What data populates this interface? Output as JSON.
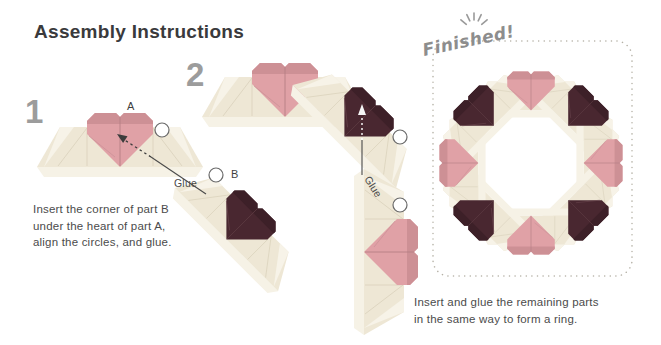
{
  "title": "Assembly Instructions",
  "colors": {
    "pink": "#e0a1a6",
    "pink_dark": "#cd9095",
    "maroon": "#492730",
    "cream": "#eee7d5",
    "cream_light": "#f6f2e6"
  },
  "step1": {
    "number": "1",
    "part_a_label": "A",
    "part_b_label": "B",
    "glue_label": "Glue",
    "lines": [
      "Insert the corner of part B",
      "under the heart of part A,",
      "align the circles, and glue."
    ]
  },
  "step2": {
    "number": "2",
    "glue_label": "Glue",
    "lines": [
      "Insert and glue the remaining parts",
      "in the same way to form a ring."
    ]
  },
  "finished": {
    "label": "Finished!"
  }
}
